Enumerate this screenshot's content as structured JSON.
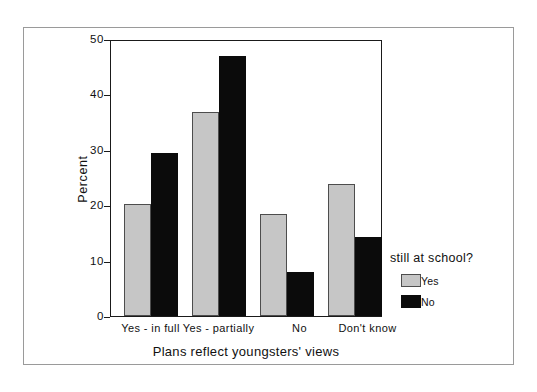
{
  "chart_data": {
    "type": "bar",
    "title": "",
    "xlabel": "Plans reflect youngsters' views",
    "ylabel": "Percent",
    "categories": [
      "Yes - in full",
      "Yes - partially",
      "No",
      "Don't know"
    ],
    "series": [
      {
        "name": "Yes",
        "color": "#c6c6c6",
        "values": [
          20.4,
          37.1,
          18.5,
          24.0
        ]
      },
      {
        "name": "No",
        "color": "#0b0b0b",
        "values": [
          29.7,
          47.3,
          8.0,
          14.3
        ]
      }
    ],
    "ylim": [
      0,
      50
    ],
    "yticks": [
      0,
      10,
      20,
      30,
      40,
      50
    ],
    "ytick_labels": [
      "0",
      "10",
      "20",
      "30",
      "40",
      "50"
    ],
    "grid": false,
    "legend": {
      "title": "still at school?",
      "position": "right",
      "entries": [
        "Yes",
        "No"
      ]
    }
  }
}
